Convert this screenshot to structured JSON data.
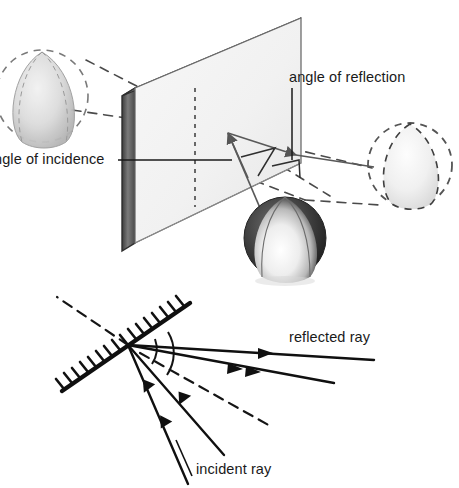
{
  "figure": {
    "background_color": "#ffffff",
    "ink_color": "#1a1a1a",
    "ray_color": "#555555",
    "dash_color": "#4a4a4a"
  },
  "labels": {
    "angle_of_incidence": "ngle of incidence",
    "angle_of_reflection": "angle of reflection",
    "reflected_ray": "reflected ray",
    "incident_ray": "incident ray"
  },
  "upper_diagram": {
    "name": "mirror-plane-perspective",
    "mirror_panel": {
      "face_color": "#f4f4f4",
      "edge_color": "#6d6d6d",
      "top_band_color": "#8a8a8a",
      "side_band_color": "#5a5a5a",
      "front_top_left": [
        135,
        88
      ],
      "front_top_right": [
        301,
        18
      ],
      "front_bottom_right": [
        301,
        163
      ],
      "front_bottom_left": [
        135,
        243
      ],
      "thickness_px": 13
    },
    "objects": [
      {
        "name": "real-ball",
        "kind": "solid-sphere",
        "cx": 285,
        "cy": 238,
        "r": 41,
        "label": "ball"
      },
      {
        "name": "virtual-image-left",
        "kind": "ghost-sphere",
        "cx": 42,
        "cy": 96,
        "r": 46,
        "label": "image"
      },
      {
        "name": "virtual-image-right",
        "kind": "ghost-sphere",
        "cx": 410,
        "cy": 165,
        "r": 42,
        "label": "image"
      }
    ],
    "reflection_point": [
      228,
      133
    ],
    "normal_line": {
      "kind": "dashed-vertical",
      "x": 195,
      "y_top": 88,
      "y_bottom": 205
    },
    "rays": [
      {
        "name": "incident-ray-3d",
        "from": [
          262,
          215
        ],
        "to": [
          228,
          133
        ],
        "arrow": true
      },
      {
        "name": "reflected-ray-3d",
        "from": [
          228,
          133
        ],
        "to": [
          300,
          157
        ],
        "arrow": true
      },
      {
        "name": "reflected-ray-extension",
        "from": [
          300,
          157
        ],
        "to": [
          372,
          168
        ],
        "arrow": false
      }
    ]
  },
  "lower_diagram": {
    "name": "ray-diagram",
    "vertex": [
      128,
      345
    ],
    "mirror": {
      "name": "hatched-mirror-line",
      "from": [
        62,
        391
      ],
      "to": [
        187,
        305
      ],
      "hatch_side": "upper-left",
      "hatch_count": 18
    },
    "normal": {
      "kind": "dashed",
      "from": [
        128,
        345
      ],
      "to": [
        57,
        297
      ]
    },
    "normal_extension": {
      "kind": "dashed",
      "from": [
        128,
        345
      ],
      "to": [
        272,
        425
      ]
    },
    "incident_rays": [
      {
        "name": "incident-ray-1",
        "from": [
          187,
          482
        ],
        "to": [
          128,
          345
        ],
        "arrow_at": 0.45
      },
      {
        "name": "incident-ray-2",
        "from": [
          223,
          452
        ],
        "to": [
          128,
          345
        ],
        "arrow_at": 0.42
      }
    ],
    "reflected_rays": [
      {
        "name": "reflected-ray-1",
        "from": [
          128,
          345
        ],
        "to": [
          372,
          358
        ],
        "arrow_at": 0.58
      },
      {
        "name": "reflected-ray-2",
        "from": [
          128,
          345
        ],
        "to": [
          332,
          383
        ],
        "arrow_at": 0.55
      }
    ],
    "angle_arcs": [
      {
        "name": "angle-of-incidence-arc",
        "radius": 28
      },
      {
        "name": "angle-of-reflection-arc",
        "radius": 40
      }
    ]
  }
}
